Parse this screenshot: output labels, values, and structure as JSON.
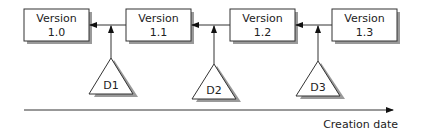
{
  "versions": [
    {
      "line1": "Version",
      "line2": "1.0"
    },
    {
      "line1": "Version",
      "line2": "1.1"
    },
    {
      "line1": "Version",
      "line2": "1.2"
    },
    {
      "line1": "Version",
      "line2": "1.3"
    }
  ],
  "deltas": [
    {
      "label": "D1"
    },
    {
      "label": "D2"
    },
    {
      "label": "D3"
    }
  ],
  "axis": {
    "label": "Creation date"
  },
  "colors": {
    "stroke": "#333333",
    "shadow": "#9a9a9a",
    "fill": "#ffffff"
  }
}
